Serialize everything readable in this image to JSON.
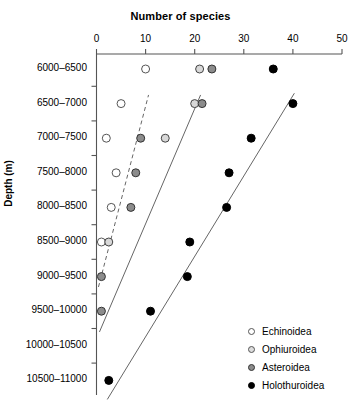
{
  "chart_data": {
    "type": "scatter",
    "title": "Number of species",
    "xlabel": "Number of species",
    "ylabel": "Depth (m)",
    "xlim": [
      0,
      50
    ],
    "xticks": [
      0,
      10,
      20,
      30,
      40,
      50
    ],
    "xtick_labels": [
      "0",
      "10",
      "20",
      "30",
      "40",
      "50"
    ],
    "grid": false,
    "legend_position": "bottom-right",
    "categories": [
      "6000–6500",
      "6500–7000",
      "7000–7500",
      "7500–8000",
      "8000–8500",
      "8500–9000",
      "9000–9500",
      "9500–10000",
      "10000–10500",
      "10500–11000"
    ],
    "series": [
      {
        "name": "Echinoidea",
        "marker": "open-circle",
        "fill": "#ffffff",
        "stroke": "#555555",
        "trendline": "dashed",
        "values": [
          10,
          5,
          2,
          4,
          3,
          1,
          null,
          null,
          null,
          null
        ]
      },
      {
        "name": "Ophiuroidea",
        "marker": "light-gray-circle",
        "fill": "#d8d8d8",
        "stroke": "#444444",
        "trendline": "solid",
        "values": [
          21,
          20,
          14,
          null,
          null,
          2.5,
          null,
          null,
          null,
          null
        ]
      },
      {
        "name": "Asteroidea",
        "marker": "gray-circle",
        "fill": "#8c8c8c",
        "stroke": "#333333",
        "trendline": null,
        "values": [
          23.5,
          21.5,
          9,
          8,
          7,
          null,
          1,
          1,
          null,
          null
        ]
      },
      {
        "name": "Holothuroidea",
        "marker": "black-circle",
        "fill": "#000000",
        "stroke": "#000000",
        "trendline": "solid",
        "values": [
          36,
          40,
          31.5,
          27,
          26.5,
          19,
          18.5,
          11,
          null,
          2.5
        ]
      }
    ],
    "trendlines": [
      {
        "series": "Echinoidea",
        "style": "dashed",
        "x1": 0.4,
        "y1": 6.3,
        "x2": 10.6,
        "y2": 0.75
      },
      {
        "series": "Ophiuroidea",
        "style": "solid",
        "x1": 0.6,
        "y1": 7.6,
        "x2": 21.2,
        "y2": 0.75
      },
      {
        "series": "Holothuroidea",
        "style": "solid",
        "x1": 2.2,
        "y1": 9.55,
        "x2": 40.3,
        "y2": 0.7
      }
    ]
  },
  "legend": {
    "items": [
      {
        "label": "Echinoidea",
        "fill": "#ffffff",
        "stroke": "#555555"
      },
      {
        "label": "Ophiuroidea",
        "fill": "#dcdcdc",
        "stroke": "#555555"
      },
      {
        "label": "Asteroidea",
        "fill": "#8c8c8c",
        "stroke": "#333333"
      },
      {
        "label": "Holothuroidea",
        "fill": "#000000",
        "stroke": "#000000"
      }
    ]
  }
}
